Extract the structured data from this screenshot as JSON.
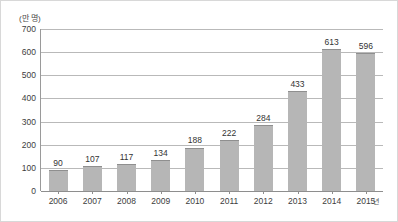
{
  "chart_data": {
    "type": "bar",
    "title": "",
    "subtitle": "",
    "xlabel": "",
    "ylabel": "",
    "y_unit_label": "(만 명)",
    "x_axis_suffix": "년",
    "categories": [
      "2006",
      "2007",
      "2008",
      "2009",
      "2010",
      "2011",
      "2012",
      "2013",
      "2014",
      "2015"
    ],
    "values": [
      90,
      107,
      117,
      134,
      188,
      222,
      284,
      433,
      613,
      596
    ],
    "value_labels": [
      "90",
      "107",
      "117",
      "134",
      "188",
      "222",
      "284",
      "433",
      "613",
      "596"
    ],
    "ylim": [
      0,
      700
    ],
    "y_ticks": [
      0,
      100,
      200,
      300,
      400,
      500,
      600,
      700
    ],
    "y_tick_labels": [
      "0",
      "100",
      "200",
      "300",
      "400",
      "500",
      "600",
      "700"
    ],
    "grid": true,
    "grid_orientation": "horizontal",
    "legend": false,
    "legend_position": "none",
    "bar_color": "#b6b6b6",
    "bar_edge_color": "#8f8f8f",
    "grid_color": "#b9b9b9",
    "axis_color": "#8e8e8e",
    "text_color": "#333333",
    "background_color": "#ffffff",
    "border_color": "#d8d8d8"
  }
}
